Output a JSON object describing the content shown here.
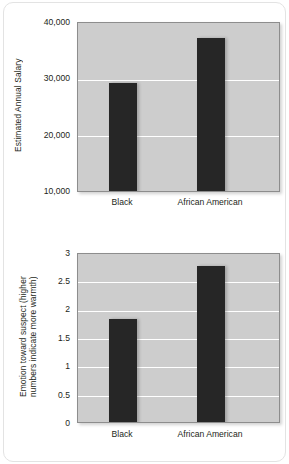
{
  "figure": {
    "background_color": "#ffffff",
    "panel_border_color": "#e3e3e3",
    "plot_fill_color": "#cdcdcd",
    "plot_border_color": "#8d8d8d",
    "gridline_color": "#ffffff",
    "bar_color": "#262626"
  },
  "chart_data": [
    {
      "type": "bar",
      "title": "",
      "xlabel": "",
      "ylabel": "Estimated Annual Salary",
      "categories": [
        "Black",
        "African American"
      ],
      "values": [
        29500,
        37300
      ],
      "ylim": [
        10000,
        40000
      ],
      "yticks": [
        10000,
        20000,
        30000,
        40000
      ],
      "ytick_labels": [
        "10,000",
        "20,000",
        "30,000",
        "40,000"
      ],
      "grid": true,
      "legend": "none"
    },
    {
      "type": "bar",
      "title": "",
      "xlabel": "",
      "ylabel": "Emotion toward suspect (higher\nnumbers indicate more warmth)",
      "categories": [
        "Black",
        "African American"
      ],
      "values": [
        1.85,
        2.79
      ],
      "ylim": [
        0,
        3
      ],
      "yticks": [
        0,
        0.5,
        1,
        1.5,
        2,
        2.5,
        3
      ],
      "ytick_labels": [
        "0",
        "0.5",
        "1",
        "1.5",
        "2",
        "2.5",
        "3"
      ],
      "grid": true,
      "legend": "none"
    }
  ]
}
